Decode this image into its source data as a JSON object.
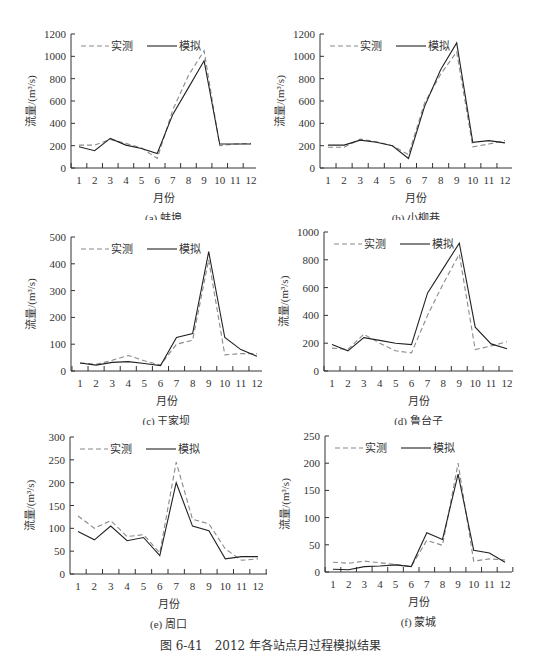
{
  "figure_caption": "图 6-41　2012 年各站点月过程模拟结果",
  "legend": {
    "observed": "实测",
    "simulated": "模拟"
  },
  "colors": {
    "observed": "#8a8a8a",
    "simulated": "#222222",
    "axis": "#333333"
  },
  "chart_data": [
    {
      "type": "line",
      "id": "a",
      "title": "(a) 蚌埠",
      "xlabel": "月份",
      "ylabel": "流量/(m³/s)",
      "x": [
        1,
        2,
        3,
        4,
        5,
        6,
        7,
        8,
        9,
        10,
        11,
        12
      ],
      "ylim": [
        0,
        1200
      ],
      "yticks": [
        0,
        200,
        400,
        600,
        800,
        1000,
        1200
      ],
      "series": [
        {
          "name": "实测",
          "style": "dashed",
          "values": [
            205,
            205,
            255,
            220,
            180,
            85,
            520,
            830,
            1050,
            200,
            215,
            220
          ]
        },
        {
          "name": "模拟",
          "style": "solid",
          "values": [
            190,
            155,
            265,
            205,
            175,
            130,
            480,
            720,
            960,
            215,
            215,
            215
          ]
        }
      ],
      "grid": false,
      "legend_position": "top-left"
    },
    {
      "type": "line",
      "id": "b",
      "title": "(b) 小柳巷",
      "xlabel": "月份",
      "ylabel": "流量/(m³/s)",
      "x": [
        1,
        2,
        3,
        4,
        5,
        6,
        7,
        8,
        9,
        10,
        11,
        12
      ],
      "ylim": [
        0,
        1200
      ],
      "yticks": [
        0,
        200,
        400,
        600,
        800,
        1000,
        1200
      ],
      "series": [
        {
          "name": "实测",
          "style": "dashed",
          "values": [
            185,
            185,
            260,
            235,
            200,
            120,
            580,
            840,
            1040,
            190,
            215,
            245
          ]
        },
        {
          "name": "模拟",
          "style": "solid",
          "values": [
            205,
            205,
            250,
            230,
            200,
            85,
            550,
            880,
            1120,
            230,
            245,
            225
          ]
        }
      ],
      "grid": false,
      "legend_position": "top-left"
    },
    {
      "type": "line",
      "id": "c",
      "title": "(c) 王家坝",
      "xlabel": "月份",
      "ylabel": "流量/(m³/s)",
      "x": [
        1,
        2,
        3,
        4,
        5,
        6,
        7,
        8,
        9,
        10,
        11,
        12
      ],
      "ylim": [
        0,
        500
      ],
      "yticks": [
        0,
        100,
        200,
        300,
        400,
        500
      ],
      "series": [
        {
          "name": "实测",
          "style": "dashed",
          "values": [
            30,
            25,
            40,
            58,
            38,
            22,
            100,
            115,
            415,
            60,
            65,
            65
          ]
        },
        {
          "name": "模拟",
          "style": "solid",
          "values": [
            30,
            22,
            32,
            35,
            28,
            20,
            125,
            140,
            445,
            125,
            80,
            55
          ]
        }
      ],
      "grid": false,
      "legend_position": "top-left"
    },
    {
      "type": "line",
      "id": "d",
      "title": "(d) 鲁台子",
      "xlabel": "月份",
      "ylabel": "流量/(m³/s)",
      "x": [
        1,
        2,
        3,
        4,
        5,
        6,
        7,
        8,
        9,
        10,
        11,
        12
      ],
      "ylim": [
        0,
        1000
      ],
      "yticks": [
        0,
        200,
        400,
        600,
        800,
        1000
      ],
      "series": [
        {
          "name": "实测",
          "style": "dashed",
          "values": [
            165,
            155,
            265,
            200,
            145,
            130,
            400,
            630,
            840,
            155,
            180,
            210
          ]
        },
        {
          "name": "模拟",
          "style": "solid",
          "values": [
            190,
            145,
            240,
            220,
            200,
            190,
            560,
            740,
            920,
            315,
            195,
            160
          ]
        }
      ],
      "grid": false,
      "legend_position": "top-left"
    },
    {
      "type": "line",
      "id": "e",
      "title": "(e) 周口",
      "xlabel": "月份",
      "ylabel": "流量/(m³/s)",
      "x": [
        1,
        2,
        3,
        4,
        5,
        6,
        7,
        8,
        9,
        10,
        11,
        12
      ],
      "ylim": [
        0,
        300
      ],
      "yticks": [
        0,
        50,
        100,
        150,
        200,
        250,
        300
      ],
      "series": [
        {
          "name": "实测",
          "style": "dashed",
          "values": [
            127,
            100,
            117,
            82,
            86,
            46,
            245,
            120,
            110,
            55,
            30,
            33
          ]
        },
        {
          "name": "模拟",
          "style": "solid",
          "values": [
            93,
            75,
            105,
            73,
            80,
            40,
            200,
            105,
            95,
            33,
            38,
            38
          ]
        }
      ],
      "grid": false,
      "legend_position": "top-left"
    },
    {
      "type": "line",
      "id": "f",
      "title": "(f) 蒙城",
      "xlabel": "月份",
      "ylabel": "流量/(m³/s)",
      "x": [
        1,
        2,
        3,
        4,
        5,
        6,
        7,
        8,
        9,
        10,
        11,
        12
      ],
      "ylim": [
        0,
        250
      ],
      "yticks": [
        0,
        50,
        100,
        150,
        200,
        250
      ],
      "series": [
        {
          "name": "实测",
          "style": "dashed",
          "values": [
            18,
            16,
            20,
            17,
            14,
            10,
            58,
            49,
            200,
            20,
            24,
            22
          ]
        },
        {
          "name": "模拟",
          "style": "solid",
          "values": [
            5,
            4,
            10,
            11,
            13,
            10,
            72,
            60,
            180,
            40,
            35,
            18
          ]
        }
      ],
      "grid": false,
      "legend_position": "top-left"
    }
  ]
}
